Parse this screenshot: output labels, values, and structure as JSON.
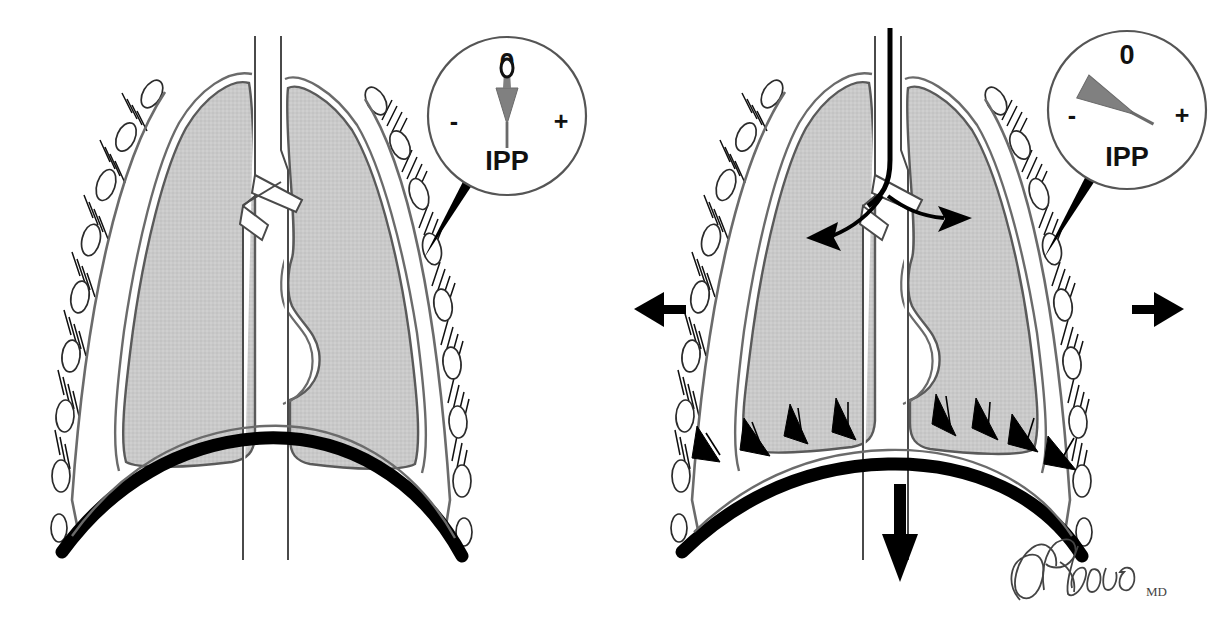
{
  "figure": {
    "background_color": "#ffffff",
    "width": 1230,
    "height": 624
  },
  "palette": {
    "lung_fill": "#c9c9c9",
    "lung_outline": "#4a4a4a",
    "pleura_line": "#6b6b6b",
    "rib_outline": "#333333",
    "diaphragm": "#000000",
    "arrow": "#000000",
    "needle": "#808080",
    "gauge_outline": "#555555",
    "text": "#111111",
    "signature": "#444444"
  },
  "panels": [
    {
      "id": "left-panel",
      "name": "resting-expiration-panel",
      "gauge": {
        "name": "ipp-gauge-left",
        "label": "IPP",
        "zero_mark": "0",
        "minus_mark": "-",
        "plus_mark": "+",
        "needle_angle_deg": 0,
        "needle_state": "upright-at-zero"
      },
      "structures": [
        "rib-cage",
        "intercostal-muscles",
        "parietal-pleura",
        "visceral-pleura",
        "right-lung",
        "left-lung",
        "trachea",
        "main-bronchi",
        "diaphragm-domed"
      ],
      "arrows": []
    },
    {
      "id": "right-panel",
      "name": "inspiration-panel",
      "gauge": {
        "name": "ipp-gauge-right",
        "label": "IPP",
        "zero_mark": "0",
        "minus_mark": "-",
        "plus_mark": "+",
        "needle_angle_deg": -62,
        "needle_state": "deflected-toward-negative"
      },
      "structures": [
        "rib-cage",
        "intercostal-muscles",
        "parietal-pleura",
        "visceral-pleura",
        "right-lung",
        "left-lung",
        "trachea",
        "main-bronchi",
        "diaphragm-flattened"
      ],
      "arrows": [
        {
          "name": "airflow-arrow-trachea",
          "direction": "down",
          "meaning": "air entering trachea"
        },
        {
          "name": "airflow-arrow-right-lung",
          "direction": "right",
          "meaning": "air into lung"
        },
        {
          "name": "airflow-arrow-left-lung",
          "direction": "left",
          "meaning": "air into lung"
        },
        {
          "name": "chest-expansion-arrow-left",
          "direction": "left",
          "meaning": "rib cage expands outward"
        },
        {
          "name": "chest-expansion-arrow-right",
          "direction": "right",
          "meaning": "rib cage expands outward"
        },
        {
          "name": "diaphragm-descent-arrow",
          "direction": "down",
          "meaning": "diaphragm contracts and descends"
        },
        {
          "name": "pleural-traction-arrows",
          "count": 8,
          "direction": "down-outward",
          "meaning": "lung pulled toward expanding thorax"
        }
      ]
    }
  ],
  "signature": {
    "name": "artist-signature",
    "text": "Brada",
    "credential": "MD"
  }
}
